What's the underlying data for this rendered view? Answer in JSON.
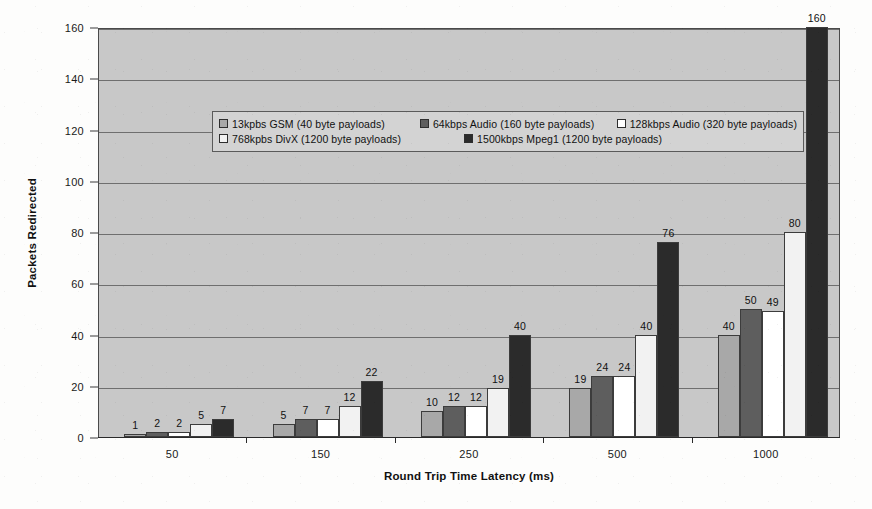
{
  "chart_data": {
    "type": "bar",
    "title": "",
    "xlabel": "Round Trip Time Latency (ms)",
    "ylabel": "Packets Redirected",
    "categories": [
      "50",
      "150",
      "250",
      "500",
      "1000"
    ],
    "ylim": [
      0,
      160
    ],
    "y_ticks": [
      0,
      20,
      40,
      60,
      80,
      100,
      120,
      140,
      160
    ],
    "grid": true,
    "legend_position": "inside-top-left",
    "series": [
      {
        "name": "13kpbs GSM (40 byte payloads)",
        "color": "#a8a8a8",
        "values": [
          1,
          5,
          10,
          19,
          40
        ]
      },
      {
        "name": "64kbps Audio (160 byte payloads)",
        "color": "#5e5e5e",
        "values": [
          2,
          7,
          12,
          24,
          50
        ]
      },
      {
        "name": "128kbps Audio (320 byte payloads)",
        "color": "#ffffff",
        "values": [
          2,
          7,
          12,
          24,
          49
        ]
      },
      {
        "name": "768kpbs DivX (1200 byte payloads)",
        "color": "#f2f2f2",
        "values": [
          5,
          12,
          19,
          40,
          80
        ]
      },
      {
        "name": "1500kbps Mpeg1 (1200 byte payloads)",
        "color": "#2b2b2b",
        "values": [
          7,
          22,
          40,
          76,
          160
        ]
      }
    ]
  },
  "legend": {
    "rows": [
      [
        {
          "label": "13kpbs GSM (40 byte payloads)",
          "color": "#a8a8a8"
        },
        {
          "label": "64kbps Audio (160 byte payloads)",
          "color": "#5e5e5e"
        },
        {
          "label": "128kbps Audio (320 byte payloads)",
          "color": "#ffffff"
        }
      ],
      [
        {
          "label": "768kpbs DivX (1200 byte payloads)",
          "color": "#f2f2f2"
        },
        {
          "label": "1500kbps Mpeg1 (1200 byte payloads)",
          "color": "#2b2b2b"
        }
      ]
    ]
  },
  "colors": {
    "plot_background": "#c8c8c8",
    "gridline": "#6f6f6f",
    "axis": "#2a2a2a",
    "text": "#111111"
  }
}
